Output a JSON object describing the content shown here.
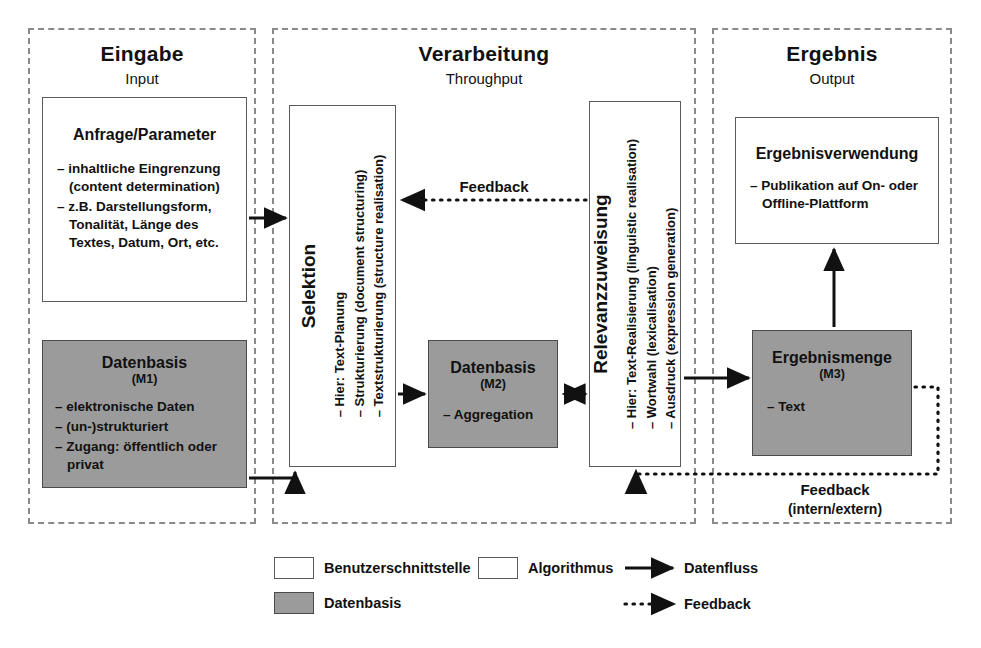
{
  "diagram": {
    "panels": [
      {
        "title": "Eingabe",
        "subtitle": "Input"
      },
      {
        "title": "Verarbeitung",
        "subtitle": "Throughput"
      },
      {
        "title": "Ergebnis",
        "subtitle": "Output"
      }
    ],
    "boxes": {
      "anfrage": {
        "title": "Anfrage/Parameter",
        "bullets": [
          "– inhaltliche Eingrenzung\n(content determination)",
          "– z.B. Darstellungsform,\nTonalität, Länge des\nTextes, Datum, Ort, etc."
        ]
      },
      "datenbasis_m1": {
        "title": "Datenbasis",
        "subtitle": "(M1)",
        "bullets": [
          "– elektronische Daten",
          "– (un-)strukturiert",
          "– Zugang: öffentlich oder\nprivat"
        ]
      },
      "selektion": {
        "title": "Selektion",
        "bullets": [
          "– Hier: Text-Planung",
          "– Strukturierung (document structuring)",
          "– Textstrukturierung (structure realisation)"
        ]
      },
      "datenbasis_m2": {
        "title": "Datenbasis",
        "subtitle": "(M2)",
        "bullets": [
          "– Aggregation"
        ]
      },
      "relevanz": {
        "title": "Relevanzzuweisung",
        "bullets": [
          "– Hier: Text-Realisierung (linguistic realisation)",
          "– Wortwahl (lexicalisation)",
          "– Ausdruck (expression generation)"
        ]
      },
      "ergebnisverwendung": {
        "title": "Ergebnisverwendung",
        "bullets": [
          "– Publikation auf On- oder\nOffline-Plattform"
        ]
      },
      "ergebnismenge": {
        "title": "Ergebnismenge",
        "subtitle": "(M3)",
        "bullets": [
          "– Text"
        ]
      }
    },
    "labels": {
      "feedback_top": "Feedback",
      "feedback_bottom": "Feedback",
      "feedback_bottom_sub": "(intern/extern)"
    },
    "legend": {
      "benutzerschnittstelle": "Benutzerschnittstelle",
      "datenbasis": "Datenbasis",
      "algorithmus": "Algorithmus",
      "datenfluss": "Datenfluss",
      "feedback": "Feedback"
    },
    "colors": {
      "gray_fill": "#9b9b9b",
      "box_stroke": "#5b5b5b",
      "panel_dash": "#8a8a8a",
      "arrow": "#111111",
      "page_bg": "#ffffff"
    }
  }
}
